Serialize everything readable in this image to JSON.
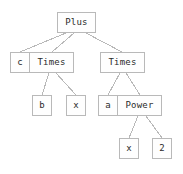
{
  "diagram": {
    "type": "expression-tree",
    "title": "Plus",
    "colors": {
      "background": "#ffffff",
      "node_border": "#b9b9b9",
      "node_fill": "#fefefe",
      "text": "#2b2b2b",
      "edge": "#b9b9b9"
    },
    "nodes": [
      {
        "id": "plus",
        "label": "Plus",
        "level": 0,
        "x": 57,
        "y": 12,
        "w": 39,
        "h": 21,
        "joined": false
      },
      {
        "id": "c",
        "label": "c",
        "level": 1,
        "x": 10,
        "y": 52,
        "w": 20,
        "h": 21,
        "joined": false
      },
      {
        "id": "times1",
        "label": "Times",
        "level": 1,
        "x": 30,
        "y": 52,
        "w": 45,
        "h": 21,
        "joined": true
      },
      {
        "id": "times2",
        "label": "Times",
        "level": 1,
        "x": 100,
        "y": 52,
        "w": 45,
        "h": 21,
        "joined": false
      },
      {
        "id": "b",
        "label": "b",
        "level": 2,
        "x": 32,
        "y": 95,
        "w": 20,
        "h": 21,
        "joined": false
      },
      {
        "id": "x1",
        "label": "x",
        "level": 2,
        "x": 66,
        "y": 95,
        "w": 20,
        "h": 21,
        "joined": false
      },
      {
        "id": "a",
        "label": "a",
        "level": 2,
        "x": 98,
        "y": 95,
        "w": 20,
        "h": 21,
        "joined": false
      },
      {
        "id": "power",
        "label": "Power",
        "level": 2,
        "x": 118,
        "y": 95,
        "w": 45,
        "h": 21,
        "joined": true
      },
      {
        "id": "x2",
        "label": "x",
        "level": 3,
        "x": 119,
        "y": 138,
        "w": 20,
        "h": 21,
        "joined": false
      },
      {
        "id": "two",
        "label": "2",
        "level": 3,
        "x": 152,
        "y": 138,
        "w": 20,
        "h": 21,
        "joined": false
      }
    ],
    "edges": [
      {
        "from": "plus",
        "to": "c",
        "x1": 66,
        "y1": 33,
        "x2": 20,
        "y2": 52
      },
      {
        "from": "plus",
        "to": "times1",
        "x1": 74,
        "y1": 33,
        "x2": 52,
        "y2": 52
      },
      {
        "from": "plus",
        "to": "times2",
        "x1": 86,
        "y1": 33,
        "x2": 122,
        "y2": 52
      },
      {
        "from": "times1",
        "to": "b",
        "x1": 49,
        "y1": 73,
        "x2": 42,
        "y2": 95
      },
      {
        "from": "times1",
        "to": "x1",
        "x1": 56,
        "y1": 73,
        "x2": 76,
        "y2": 95
      },
      {
        "from": "times2",
        "to": "a",
        "x1": 120,
        "y1": 73,
        "x2": 108,
        "y2": 95
      },
      {
        "from": "times2",
        "to": "power",
        "x1": 126,
        "y1": 73,
        "x2": 140,
        "y2": 95
      },
      {
        "from": "power",
        "to": "x2",
        "x1": 138,
        "y1": 116,
        "x2": 129,
        "y2": 138
      },
      {
        "from": "power",
        "to": "two",
        "x1": 146,
        "y1": 116,
        "x2": 162,
        "y2": 138
      }
    ]
  }
}
